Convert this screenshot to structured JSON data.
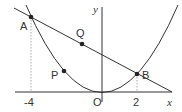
{
  "diagram": {
    "axes": {
      "x_label": "x",
      "y_label": "y",
      "origin_label": "O",
      "tick_labels": [
        "-4",
        "2"
      ]
    },
    "points": {
      "A": {
        "label": "A",
        "x": -4
      },
      "B": {
        "label": "B",
        "x": 2
      },
      "P": {
        "label": "P"
      },
      "Q": {
        "label": "Q"
      }
    },
    "colors": {
      "curve": "#333333",
      "axis": "#333333",
      "guide": "#aaaaaa",
      "text": "#333333"
    }
  }
}
